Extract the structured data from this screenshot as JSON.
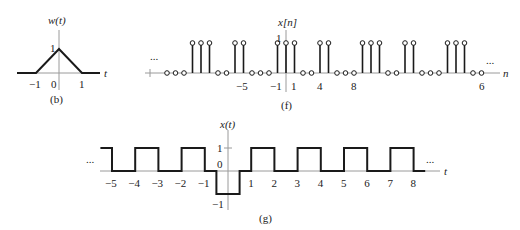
{
  "figure_b": {
    "ylabel": "w(t)",
    "xlabel": "t",
    "caption": "(b)",
    "tick_labels": [
      "−1",
      "0",
      "1"
    ],
    "y_tick_label": "1",
    "signal": {
      "type": "triangle",
      "points": [
        [
          -1.6,
          0
        ],
        [
          -1,
          0
        ],
        [
          0,
          1
        ],
        [
          1,
          0
        ],
        [
          1.6,
          0
        ]
      ]
    }
  },
  "figure_f": {
    "ylabel": "x[n]",
    "xlabel": "n",
    "caption": "(f)",
    "ellipsis_left": "...",
    "ellipsis_right": "...",
    "y_tick_label": "1",
    "tick_labels": [
      {
        "n": -5,
        "label": "−5"
      },
      {
        "n": -1,
        "label": "−1"
      },
      {
        "n": 1,
        "label": "1"
      },
      {
        "n": 4,
        "label": "4"
      },
      {
        "n": 8,
        "label": "8"
      },
      {
        "n": 23,
        "label": "6"
      }
    ],
    "samples": {
      "n": [
        -14,
        -13,
        -12,
        -11,
        -10,
        -9,
        -8,
        -7,
        -6,
        -5,
        -4,
        -3,
        -2,
        -1,
        0,
        1,
        2,
        3,
        4,
        5,
        6,
        7,
        8,
        9,
        10,
        11,
        12,
        13,
        14,
        15,
        16,
        17,
        18,
        19,
        20,
        21,
        22,
        23
      ],
      "values": [
        0,
        0,
        0,
        1,
        1,
        1,
        0,
        0,
        1,
        1,
        0,
        0,
        0,
        1,
        1,
        1,
        0,
        0,
        1,
        1,
        0,
        0,
        0,
        1,
        1,
        1,
        0,
        0,
        1,
        1,
        0,
        0,
        0,
        1,
        1,
        1,
        0,
        0
      ]
    }
  },
  "figure_g": {
    "ylabel": "x(t)",
    "xlabel": "t",
    "caption": "(g)",
    "ellipsis_left": "...",
    "ellipsis_right": "...",
    "y_tick_labels": {
      "one": "1",
      "zero": "0",
      "minus_one": "−1"
    },
    "tick_labels": [
      "−5",
      "−4",
      "−3",
      "−2",
      "−1",
      "1",
      "2",
      "3",
      "4",
      "5",
      "6",
      "7",
      "8"
    ],
    "signal": {
      "type": "piecewise-constant",
      "segments": [
        {
          "from": -5.5,
          "to": -5,
          "value": 1
        },
        {
          "from": -5,
          "to": -4,
          "value": 0
        },
        {
          "from": -4,
          "to": -3,
          "value": 1
        },
        {
          "from": -3,
          "to": -2,
          "value": 0
        },
        {
          "from": -2,
          "to": -1,
          "value": 1
        },
        {
          "from": -1,
          "to": -0.5,
          "value": 0
        },
        {
          "from": -0.5,
          "to": 0.5,
          "value": -1
        },
        {
          "from": 0.5,
          "to": 1,
          "value": 0
        },
        {
          "from": 1,
          "to": 2,
          "value": 1
        },
        {
          "from": 2,
          "to": 3,
          "value": 0
        },
        {
          "from": 3,
          "to": 4,
          "value": 1
        },
        {
          "from": 4,
          "to": 5,
          "value": 0
        },
        {
          "from": 5,
          "to": 6,
          "value": 1
        },
        {
          "from": 6,
          "to": 7,
          "value": 0
        },
        {
          "from": 7,
          "to": 8,
          "value": 1
        },
        {
          "from": 8,
          "to": 8.5,
          "value": 0
        }
      ]
    }
  }
}
